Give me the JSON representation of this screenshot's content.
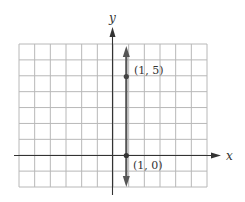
{
  "diagram": {
    "type": "coordinate-graph",
    "axes": {
      "x_label": "x",
      "y_label": "y"
    },
    "grid": {
      "columns": 12,
      "rows": 9,
      "x_range": [
        -6,
        6
      ],
      "y_range": [
        -2,
        7
      ]
    },
    "line": {
      "equation": "x = 1",
      "color": "#555555"
    },
    "points": [
      {
        "label": "(1, 5)",
        "x": 1,
        "y": 5
      },
      {
        "label": "(1, 0)",
        "x": 1,
        "y": 0
      }
    ],
    "colors": {
      "grid": "#b5b5b5",
      "axis": "#333333",
      "line": "#555555"
    }
  }
}
